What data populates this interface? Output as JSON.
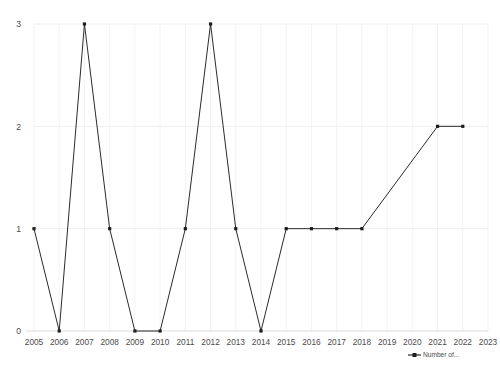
{
  "chart_data": {
    "type": "line",
    "title": "",
    "subtitle": "",
    "xlabel": "",
    "ylabel": "",
    "x": [
      2005,
      2006,
      2007,
      2008,
      2009,
      2010,
      2011,
      2012,
      2013,
      2014,
      2015,
      2016,
      2017,
      2018,
      2021,
      2022
    ],
    "categories": [
      "2005",
      "2006",
      "2007",
      "2008",
      "2009",
      "2010",
      "2011",
      "2012",
      "2013",
      "2014",
      "2015",
      "2016",
      "2017",
      "2018",
      "2019",
      "2020",
      "2021",
      "2022",
      "2023"
    ],
    "series": [
      {
        "name": "Number of...",
        "color": "#2b2b2b",
        "points": [
          {
            "x": 2005,
            "y": 1
          },
          {
            "x": 2006,
            "y": 0
          },
          {
            "x": 2007,
            "y": 3
          },
          {
            "x": 2008,
            "y": 1
          },
          {
            "x": 2009,
            "y": 0
          },
          {
            "x": 2010,
            "y": 0
          },
          {
            "x": 2011,
            "y": 1
          },
          {
            "x": 2012,
            "y": 3
          },
          {
            "x": 2013,
            "y": 1
          },
          {
            "x": 2014,
            "y": 0
          },
          {
            "x": 2015,
            "y": 1
          },
          {
            "x": 2016,
            "y": 1
          },
          {
            "x": 2017,
            "y": 1
          },
          {
            "x": 2018,
            "y": 1
          },
          {
            "x": 2021,
            "y": 2
          },
          {
            "x": 2022,
            "y": 2
          }
        ]
      }
    ],
    "xticks": [
      "2005",
      "2006",
      "2007",
      "2008",
      "2009",
      "2010",
      "2011",
      "2012",
      "2013",
      "2014",
      "2015",
      "2016",
      "2017",
      "2018",
      "2019",
      "2020",
      "2021",
      "2022",
      "2023"
    ],
    "yticks": [
      "0",
      "1",
      "2",
      "3"
    ],
    "ylim": [
      0,
      3
    ],
    "xlim": [
      2005,
      2023
    ],
    "grid": {
      "vertical": true,
      "horizontal": true,
      "color": "#f1f3f5"
    },
    "legend": {
      "position": "bottom-right",
      "entries": [
        {
          "label": "Number of...",
          "color": "#2b2b2b",
          "marker": "square"
        }
      ]
    },
    "background": "#ffffff"
  }
}
